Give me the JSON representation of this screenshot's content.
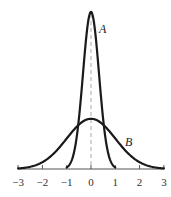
{
  "chart_data": {
    "type": "line",
    "title": "",
    "xlabel": "",
    "ylabel": "",
    "xlim": [
      -3,
      3
    ],
    "x_ticks": [
      -3,
      -2,
      -1,
      0,
      1,
      2,
      3
    ],
    "x_tick_labels": [
      "−3",
      "−2",
      "−1",
      "0",
      "1",
      "2",
      "3"
    ],
    "grid": false,
    "legend": "none (curves labeled inline)",
    "annotations": [
      {
        "text": "A",
        "near": "right of peak of narrow curve"
      },
      {
        "text": "B",
        "near": "right shoulder of wide curve"
      }
    ],
    "series": [
      {
        "name": "A",
        "description": "narrow, tall bell-shaped curve centered at 0, defined on [-1, 1]",
        "center": 0,
        "domain": [
          -1,
          1
        ],
        "relative_peak_height": 1.0
      },
      {
        "name": "B",
        "description": "wide, low bell-shaped curve centered at 0, defined on [-3, 3]",
        "center": 0,
        "domain": [
          -3,
          3
        ],
        "relative_peak_height": 0.32
      }
    ],
    "reference_lines": [
      {
        "type": "vertical",
        "x": 0,
        "style": "dashed"
      }
    ]
  },
  "labels": {
    "curve_a": "A",
    "curve_b": "B"
  }
}
